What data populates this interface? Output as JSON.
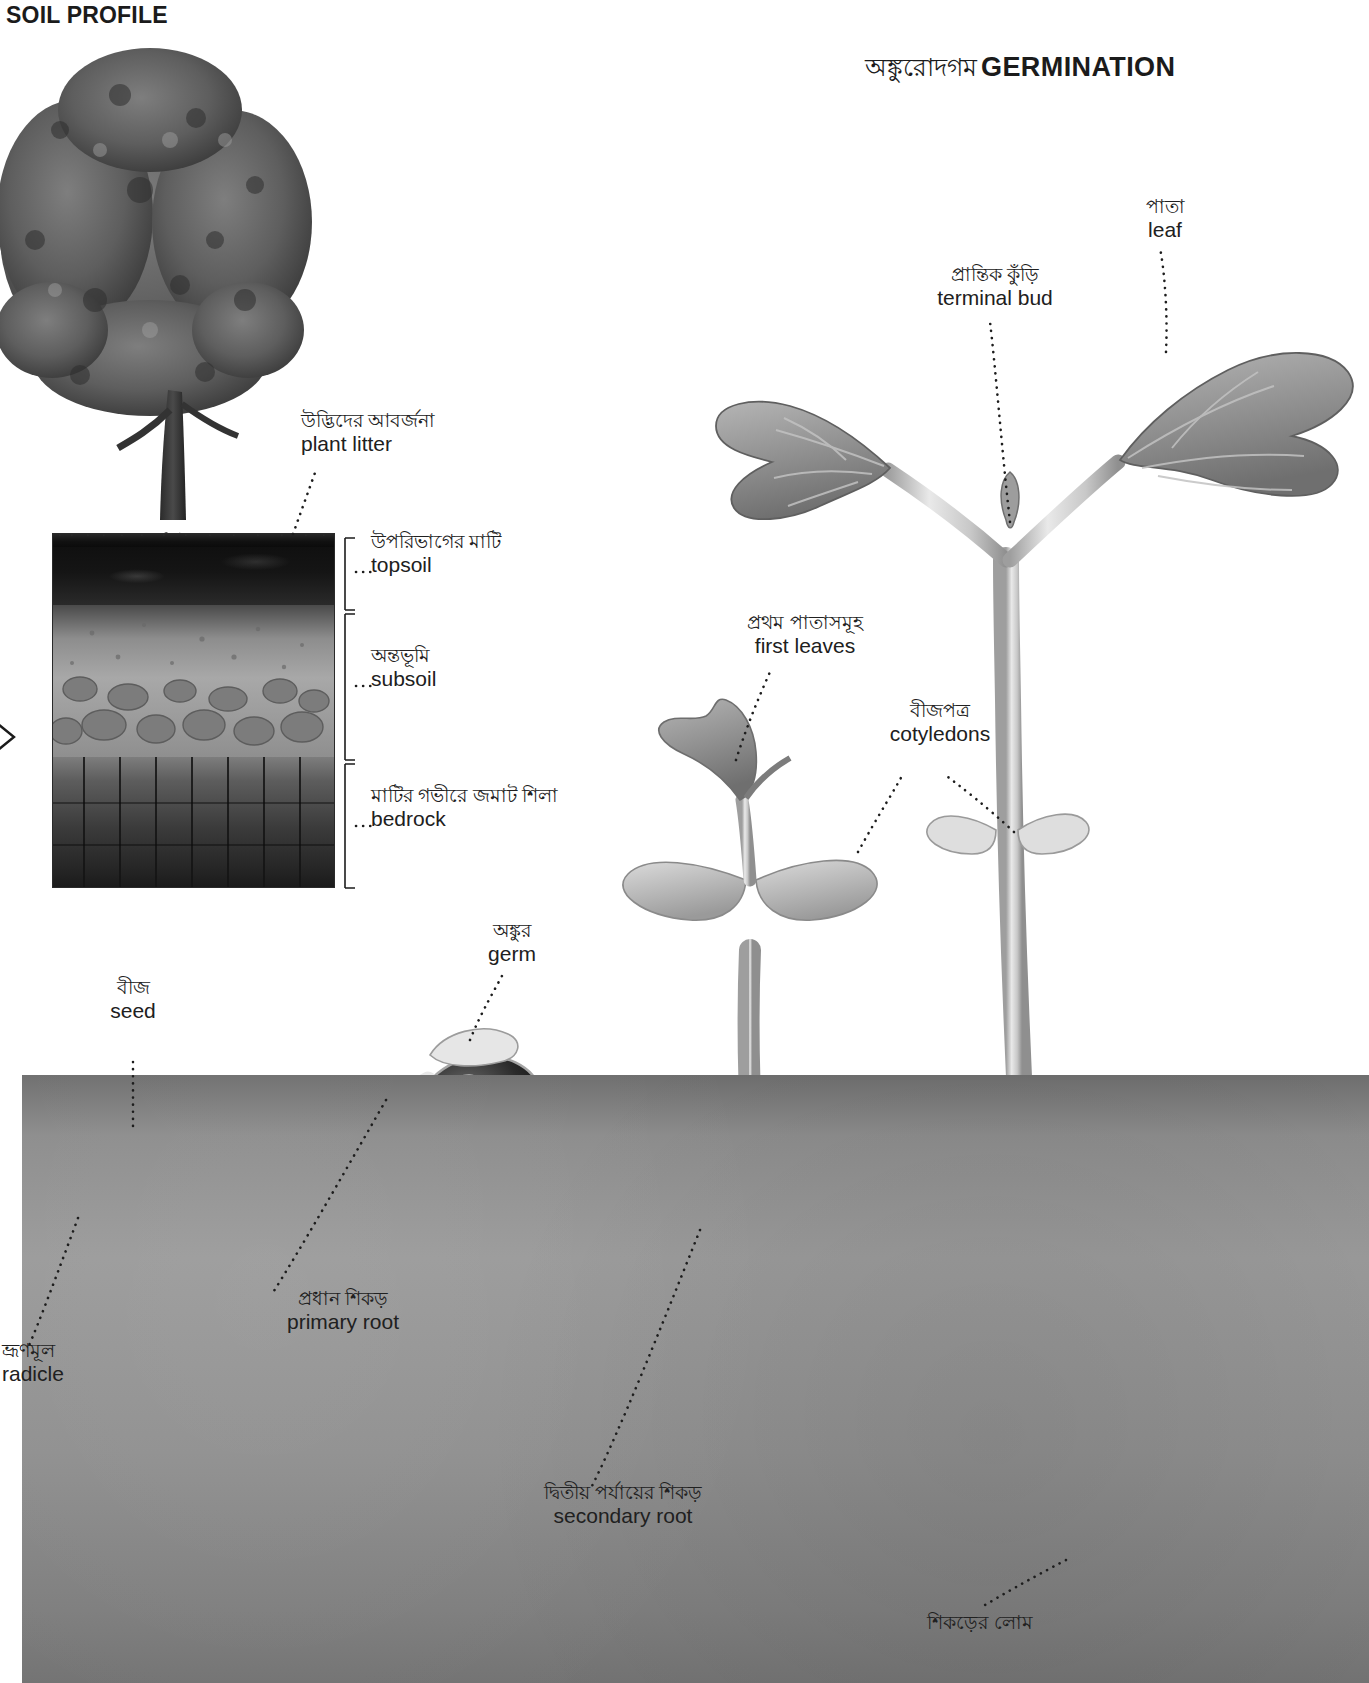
{
  "titles": {
    "soil_profile": "SOIL PROFILE",
    "germination_bn": "অঙ্কুরোদগম",
    "germination_en": "GERMINATION"
  },
  "soil_profile_labels": [
    {
      "id": "plant-litter",
      "bn": "উদ্ভিদের আবর্জনা",
      "en": "plant litter"
    },
    {
      "id": "topsoil",
      "bn": "উপরিভাগের মাটি",
      "en": "topsoil"
    },
    {
      "id": "subsoil",
      "bn": "অন্তভূমি",
      "en": "subsoil"
    },
    {
      "id": "bedrock",
      "bn": "মাটির গভীরে জমাট শিলা",
      "en": "bedrock"
    }
  ],
  "germination_labels": [
    {
      "id": "leaf",
      "bn": "পাতা",
      "en": "leaf"
    },
    {
      "id": "terminal-bud",
      "bn": "প্রান্তিক কুঁড়ি",
      "en": "terminal bud"
    },
    {
      "id": "first-leaves",
      "bn": "প্রথম পাতাসমূহ",
      "en": "first leaves"
    },
    {
      "id": "cotyledons",
      "bn": "বীজপত্র",
      "en": "cotyledons"
    },
    {
      "id": "germ",
      "bn": "অঙ্কুর",
      "en": "germ"
    },
    {
      "id": "seed",
      "bn": "বীজ",
      "en": "seed"
    },
    {
      "id": "radicle",
      "bn": "ভ্রূণমূল",
      "en": "radicle"
    },
    {
      "id": "primary-root",
      "bn": "প্রধান শিকড়",
      "en": "primary root"
    },
    {
      "id": "secondary-root",
      "bn": "দ্বিতীয় পর্যায়ের শিকড়",
      "en": "secondary root"
    },
    {
      "id": "root-hair",
      "bn": "শিকড়ের লোম",
      "en": ""
    }
  ],
  "colors": {
    "ink": "#1a1a1a",
    "topsoil": "#111111",
    "subsoil": "#a0a0a0",
    "bedrock": "#2a2a2a",
    "ground": "#8f8f8f",
    "leaf_fill": "#9a9a9a",
    "stem_fill": "#cfcfcf",
    "root_fill": "#dcdcdc"
  }
}
